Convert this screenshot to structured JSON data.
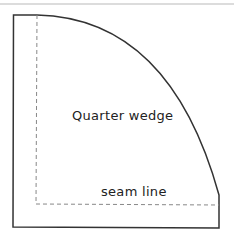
{
  "diagram": {
    "title": "Quarter wedge",
    "seam_label": "seam line",
    "colors": {
      "outline": "#333333",
      "seam": "#888888",
      "top_rule": "#cccccc"
    }
  }
}
